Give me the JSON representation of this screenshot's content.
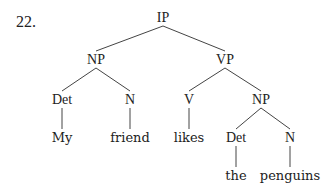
{
  "example_number": "22.",
  "line_color": "#444444",
  "nodes": [
    {
      "id": "ip",
      "label": "IP",
      "x": 163,
      "y": 18,
      "leaf": false
    },
    {
      "id": "np1",
      "label": "NP",
      "x": 96,
      "y": 60,
      "leaf": false
    },
    {
      "id": "vp",
      "label": "VP",
      "x": 225,
      "y": 60,
      "leaf": false
    },
    {
      "id": "det1",
      "label": "Det",
      "x": 62,
      "y": 100,
      "leaf": false
    },
    {
      "id": "n1",
      "label": "N",
      "x": 130,
      "y": 100,
      "leaf": false
    },
    {
      "id": "v",
      "label": "V",
      "x": 189,
      "y": 100,
      "leaf": false
    },
    {
      "id": "np2",
      "label": "NP",
      "x": 261,
      "y": 100,
      "leaf": false
    },
    {
      "id": "my",
      "label": "My",
      "x": 62,
      "y": 138,
      "leaf": true
    },
    {
      "id": "friend",
      "label": "friend",
      "x": 130,
      "y": 138,
      "leaf": true
    },
    {
      "id": "likes",
      "label": "likes",
      "x": 189,
      "y": 138,
      "leaf": true
    },
    {
      "id": "det2",
      "label": "Det",
      "x": 236,
      "y": 138,
      "leaf": false
    },
    {
      "id": "n2",
      "label": "N",
      "x": 290,
      "y": 138,
      "leaf": false
    },
    {
      "id": "the",
      "label": "the",
      "x": 236,
      "y": 176,
      "leaf": true
    },
    {
      "id": "penguins",
      "label": "penguins",
      "x": 290,
      "y": 176,
      "leaf": true
    }
  ],
  "edges": [
    [
      "ip",
      "np1"
    ],
    [
      "ip",
      "vp"
    ],
    [
      "np1",
      "det1"
    ],
    [
      "np1",
      "n1"
    ],
    [
      "vp",
      "v"
    ],
    [
      "vp",
      "np2"
    ],
    [
      "det1",
      "my"
    ],
    [
      "n1",
      "friend"
    ],
    [
      "v",
      "likes"
    ],
    [
      "np2",
      "det2"
    ],
    [
      "np2",
      "n2"
    ],
    [
      "det2",
      "the"
    ],
    [
      "n2",
      "penguins"
    ]
  ],
  "sentence": "My friend likes the penguins"
}
